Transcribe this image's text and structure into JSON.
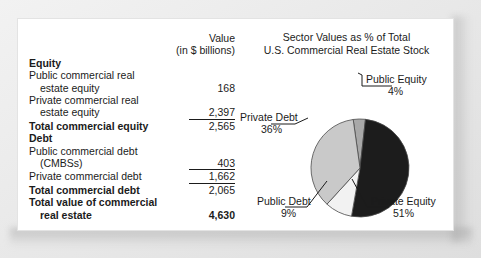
{
  "table": {
    "header": {
      "value_label": "Value",
      "units_label": "(in $ billions)"
    },
    "rows": [
      {
        "label": "Equity",
        "value": "",
        "bold": true,
        "indent": false,
        "ruled": false
      },
      {
        "label": "Public commercial real",
        "value": "",
        "bold": false,
        "indent": false,
        "ruled": false
      },
      {
        "label": "estate equity",
        "value": "168",
        "bold": false,
        "indent": true,
        "ruled": false
      },
      {
        "label": "Private commercial real",
        "value": "",
        "bold": false,
        "indent": false,
        "ruled": false
      },
      {
        "label": "estate equity",
        "value": "2,397",
        "bold": false,
        "indent": true,
        "ruled": true
      },
      {
        "label": "Total commercial equity",
        "value": "2,565",
        "bold": true,
        "indent": false,
        "ruled": false
      },
      {
        "label": "Debt",
        "value": "",
        "bold": true,
        "indent": false,
        "ruled": false
      },
      {
        "label": "Public commercial debt",
        "value": "",
        "bold": false,
        "indent": false,
        "ruled": false
      },
      {
        "label": "(CMBSs)",
        "value": "403",
        "bold": false,
        "indent": true,
        "ruled": true
      },
      {
        "label": "Private commercial debt",
        "value": "1,662",
        "bold": false,
        "indent": false,
        "ruled": true
      },
      {
        "label": "Total commercial debt",
        "value": "2,065",
        "bold": true,
        "indent": false,
        "ruled": false
      },
      {
        "label": "Total value of commercial",
        "value": "",
        "bold": true,
        "indent": false,
        "ruled": false
      },
      {
        "label": "real estate",
        "value": "4,630",
        "bold": true,
        "indent": true,
        "ruled": false
      }
    ]
  },
  "chart_data": {
    "type": "pie",
    "title": "Sector Values as % of Total U.S. Commercial Real Estate Stock",
    "title_lines": [
      "Sector Values as % of Total",
      "U.S. Commercial Real Estate Stock"
    ],
    "categories": [
      "Public Equity",
      "Private Equity",
      "Public Debt",
      "Private Debt"
    ],
    "values": [
      4,
      51,
      9,
      36
    ],
    "value_labels": [
      "4%",
      "51%",
      "9%",
      "36%"
    ],
    "colors": [
      "#a8a8a8",
      "#1c1c1c",
      "#f2f2f2",
      "#c9c9c9"
    ],
    "start_angle_deg": -8,
    "legend": "callout-labels",
    "slices": [
      {
        "name": "Public Equity",
        "percent": 4,
        "percent_label": "4%",
        "color": "#a8a8a8"
      },
      {
        "name": "Private Equity",
        "percent": 51,
        "percent_label": "51%",
        "color": "#1c1c1c"
      },
      {
        "name": "Public Debt",
        "percent": 9,
        "percent_label": "9%",
        "color": "#f2f2f2"
      },
      {
        "name": "Private Debt",
        "percent": 36,
        "percent_label": "36%",
        "color": "#c9c9c9"
      }
    ]
  }
}
